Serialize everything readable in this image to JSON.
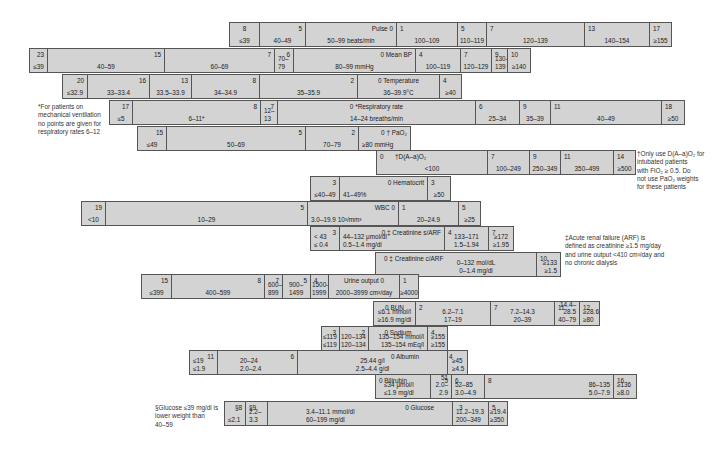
{
  "rows": {
    "pulse": {
      "label": "Pulse 0",
      "cells": [
        {
          "pts": "8",
          "range": "≤39"
        },
        {
          "pts": "5",
          "range": "40–49"
        },
        {
          "range": "50–99 beats/min"
        },
        {
          "pts": "1",
          "range": "100–109"
        },
        {
          "pts": "5",
          "range": "110–119"
        },
        {
          "pts": "7",
          "range": "120–139"
        },
        {
          "pts": "13",
          "range": "140–154"
        },
        {
          "pts": "17",
          "range": "≥155"
        }
      ]
    },
    "mean_bp": {
      "label": "0 Mean BP",
      "cells": [
        {
          "pts": "23",
          "range": "≤39"
        },
        {
          "pts": "15",
          "range": "40–59"
        },
        {
          "pts": "7",
          "range": "60–69"
        },
        {
          "pts": "6",
          "range": "70–\n79"
        },
        {
          "range": "80–99 mmHg"
        },
        {
          "pts": "4",
          "range": "100–119"
        },
        {
          "pts": "7",
          "range": "120–129"
        },
        {
          "pts": "9",
          "range": "130–\n139"
        },
        {
          "pts": "10",
          "range": "≥140"
        }
      ]
    },
    "temperature": {
      "label": "0 Temperature",
      "cells": [
        {
          "pts": "20",
          "range": "≤32.9"
        },
        {
          "pts": "16",
          "range": "33–33.4"
        },
        {
          "pts": "13",
          "range": "33.5–33.9"
        },
        {
          "pts": "8",
          "range": "34–34.9"
        },
        {
          "pts": "2",
          "range": "35–35.9"
        },
        {
          "range": "36–39.9°C"
        },
        {
          "pts": "4",
          "range": "≥40"
        }
      ]
    },
    "resp_rate": {
      "label": "0 *Respiratory rate",
      "cells": [
        {
          "pts": "17",
          "range": "≤5"
        },
        {
          "pts": "8",
          "range": "6–11*"
        },
        {
          "pts": "7",
          "range": "12–\n13"
        },
        {
          "range": "14–24 breaths/min"
        },
        {
          "pts": "6",
          "range": "25–34"
        },
        {
          "pts": "9",
          "range": "35–39"
        },
        {
          "pts": "11",
          "range": "40–49"
        },
        {
          "pts": "18",
          "range": "≥50"
        }
      ]
    },
    "pao2": {
      "label": "0 † PaO₂",
      "cells": [
        {
          "pts": "15",
          "range": "≤49"
        },
        {
          "pts": "5",
          "range": "50–69"
        },
        {
          "pts": "2",
          "range": "70–79"
        },
        {
          "range": "≥80 mmHg"
        }
      ]
    },
    "aado2": {
      "label": "†D(A–a)O₂",
      "cells": [
        {
          "pts": "0",
          "range": "<100"
        },
        {
          "pts": "7",
          "range": "100–249"
        },
        {
          "pts": "9",
          "range": "250–349"
        },
        {
          "pts": "11",
          "range": "350–499"
        },
        {
          "pts": "14",
          "range": "≥500"
        }
      ]
    },
    "hematocrit": {
      "label": "0 Hematocrit",
      "cells": [
        {
          "pts": "3",
          "range": "≤40–49"
        },
        {
          "range": "41–49%"
        },
        {
          "pts": "3",
          "range": "≥50"
        }
      ]
    },
    "wbc": {
      "label": "WBC 0",
      "cells": [
        {
          "pts": "19",
          "range": "<10"
        },
        {
          "pts": "5",
          "range": "10–29"
        },
        {
          "range": "3.0–19.9 10³/mm³"
        },
        {
          "pts": "1",
          "range": "20–24.9"
        },
        {
          "pts": "5",
          "range": "≥25"
        }
      ]
    },
    "creat_sarf": {
      "label": "0 ‡ Creatinine s/ARF",
      "cells": [
        {
          "pts": "3",
          "range": "< 43\n≤ 0.4"
        },
        {
          "range": "44–132 μmol/dl\n0.5–1.4 mg/dl"
        },
        {
          "pts": "4",
          "range": "133–171\n1.5–1.94"
        },
        {
          "pts": "7",
          "range": "≥172\n≥1.95"
        }
      ]
    },
    "creat_carf": {
      "label": "0 ‡ Creatinine c/ARF",
      "cells": [
        {
          "range": "0–132 mol/dL\n0–1.4 mg/dl"
        },
        {
          "pts": "10",
          "range": "≥133\n≥1.5"
        }
      ]
    },
    "urine": {
      "label": "Urine output 0",
      "cells": [
        {
          "pts": "15",
          "range": "≤399"
        },
        {
          "pts": "8",
          "range": "400–599"
        },
        {
          "pts": "7",
          "range": "600–\n899"
        },
        {
          "pts": "5",
          "range": "900–\n1499"
        },
        {
          "pts": "4",
          "range": "1500–\n1999"
        },
        {
          "range": "2000–3999 cm³/day"
        },
        {
          "pts": "1",
          "range": "≥4000"
        }
      ]
    },
    "bun": {
      "label": "0 BUN",
      "cells": [
        {
          "range": "≤6.1 mmol/l\n≥16.9 mg/dl"
        },
        {
          "pts": "2",
          "range": "6.2–7.1\n17–19"
        },
        {
          "pts": "7",
          "range": "7.2–14.3\n20–39"
        },
        {
          "pts": "11",
          "range": "14.4–28.5\n40–79"
        },
        {
          "pts": "12",
          "range": "≥28.6\n≥80"
        }
      ]
    },
    "sodium": {
      "label": "0 Sodium",
      "cells": [
        {
          "pts": "3",
          "range": "≤119\n≤119"
        },
        {
          "pts": "2",
          "range": "120–134\n120–134"
        },
        {
          "range": "135–154 mmol/l\n135–154 mEq/l"
        },
        {
          "pts": "4",
          "range": "≥155\n≥155"
        }
      ]
    },
    "albumin": {
      "label": "0 Albumin",
      "cells": [
        {
          "pts": "11",
          "range": "≤19\n≤1.9"
        },
        {
          "pts": "6",
          "range": "20–24\n2.0–2.4"
        },
        {
          "range": "25.44 g/l\n2.5–4.4 g/dl"
        },
        {
          "pts": "4",
          "range": "≥45\n≥4.5"
        }
      ]
    },
    "bilirubin": {
      "label": "0 Bilirubin",
      "cells": [
        {
          "range": "≤34 μmol/l\n≤1.9 mg/dl"
        },
        {
          "pts": "5",
          "range": "35–51\n2.0–2.9"
        },
        {
          "pts": "6",
          "range": "52–85\n3.0–4.9"
        },
        {
          "pts": "8",
          "range": "86–135\n5.0–7.9"
        },
        {
          "pts": "16",
          "range": "≥136\n≥8.0"
        }
      ]
    },
    "glucose": {
      "label": "0 Glucose",
      "cells": [
        {
          "pts": "§8",
          "range": "≤2.1"
        },
        {
          "pts": "§9",
          "range": "2.2–3.3"
        },
        {
          "range": "3.4–11.1 mmol/dl\n60–199 mg/dl"
        },
        {
          "pts": "3",
          "range": "11.2–19.3\n200–349"
        },
        {
          "pts": "5",
          "range": "≥19.4\n≥350"
        }
      ]
    }
  },
  "notes": {
    "resp_note": "*For patients on\nmechanical ventilation\nno points are given for\nrespiratory rates 6–12",
    "aado2_note": "†Only use D(A–a)O₂ for\nintubated patients\nwith FiO₂ ≥ 0.5. Do\nnot use PaO₂ weights\nfor these patients",
    "arf_note": "‡Acute renal failure (ARF) is\ndefined as creatinine ≥1.5 mg/day\nand urine output <410 cm³/day and\nno chronic dialysis",
    "glucose_note": "§Glucose ≤39 mg/dl is\nlower weight than\n40–59"
  },
  "colors": {
    "cell_fill": "#d3d3d3",
    "border": "#555555",
    "text": "#222222"
  }
}
